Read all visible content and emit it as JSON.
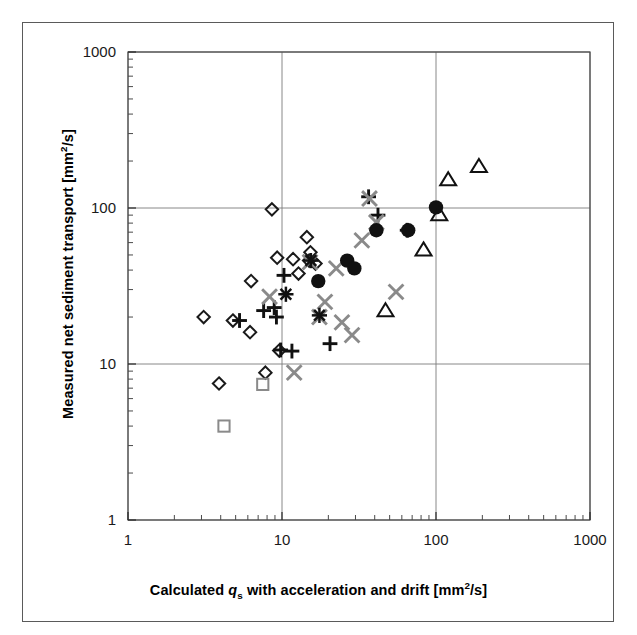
{
  "figure": {
    "title": "",
    "background_color": "#ffffff",
    "frame_color": "#5a5a5a"
  },
  "axes": {
    "x_title_parts": {
      "pre": "Calculated ",
      "italic_var": "q",
      "subscript": "s",
      "post": " with acceleration and drift  [mm",
      "superscript": "2",
      "tail": "/s]"
    },
    "y_title_parts": {
      "pre": "Measured net sediment transport  [mm",
      "superscript": "2",
      "tail": "/s]"
    },
    "x_tick_labels": [
      "1",
      "10",
      "100",
      "1000"
    ],
    "y_tick_labels": [
      "1",
      "10",
      "100",
      "1000"
    ]
  },
  "chart_data": {
    "type": "scatter",
    "title": "",
    "xlabel": "Calculated q_s with acceleration and drift  [mm2/s]",
    "ylabel": "Measured net sediment transport  [mm2/s]",
    "xscale": "log",
    "yscale": "log",
    "xlim": [
      1,
      1000
    ],
    "ylim": [
      1,
      1000
    ],
    "xticks": [
      1,
      10,
      100,
      1000
    ],
    "yticks": [
      1,
      10,
      100,
      1000
    ],
    "grid": true,
    "minor_ticks": true,
    "legend": null,
    "colors": {
      "diamond": "#1a1a1a",
      "square": "#8a8a8a",
      "plus": "#111111",
      "cross": "#8a8a8a",
      "star": "#111111",
      "circle": "#111111",
      "triangle": "#111111"
    },
    "series": [
      {
        "name": "open diamond",
        "marker": "diamond",
        "filled": false,
        "color": "#1a1a1a",
        "points": [
          [
            8.6,
            98
          ],
          [
            9.3,
            48
          ],
          [
            11.8,
            47
          ],
          [
            12.8,
            38
          ],
          [
            14.5,
            65
          ],
          [
            15.3,
            52
          ],
          [
            16.5,
            44
          ],
          [
            3.1,
            20
          ],
          [
            4.8,
            19
          ],
          [
            6.2,
            16
          ],
          [
            9.6,
            12.2
          ],
          [
            3.9,
            7.5
          ],
          [
            7.8,
            8.8
          ],
          [
            6.3,
            34
          ],
          [
            15.0,
            46
          ]
        ]
      },
      {
        "name": "open square",
        "marker": "square",
        "filled": false,
        "color": "#8a8a8a",
        "points": [
          [
            7.5,
            7.4
          ],
          [
            4.2,
            4.0
          ]
        ]
      },
      {
        "name": "plus",
        "marker": "plus",
        "filled": true,
        "color": "#111111",
        "points": [
          [
            7.6,
            22
          ],
          [
            8.9,
            23
          ],
          [
            5.3,
            19
          ],
          [
            9.2,
            20
          ],
          [
            9.8,
            12.3
          ],
          [
            11.6,
            12.1
          ],
          [
            10.3,
            37
          ],
          [
            36.5,
            118
          ],
          [
            20.5,
            13.5
          ],
          [
            65,
            72
          ],
          [
            42,
            90
          ]
        ]
      },
      {
        "name": "gray cross",
        "marker": "cross",
        "filled": true,
        "color": "#8a8a8a",
        "points": [
          [
            12.0,
            8.8
          ],
          [
            15.2,
            45
          ],
          [
            19.0,
            25
          ],
          [
            22.5,
            41
          ],
          [
            24.5,
            18.5
          ],
          [
            28.5,
            15.3
          ],
          [
            33,
            62
          ],
          [
            37,
            115
          ],
          [
            41,
            81
          ],
          [
            55,
            29
          ],
          [
            17.5,
            20
          ],
          [
            8.3,
            27
          ]
        ]
      },
      {
        "name": "black star",
        "marker": "star",
        "filled": true,
        "color": "#111111",
        "points": [
          [
            10.6,
            28
          ],
          [
            15.4,
            46
          ],
          [
            17.5,
            20.5
          ]
        ]
      },
      {
        "name": "filled circle",
        "marker": "circle",
        "filled": true,
        "color": "#111111",
        "points": [
          [
            17.2,
            34
          ],
          [
            26.5,
            46
          ],
          [
            29.5,
            41
          ],
          [
            41,
            72
          ],
          [
            66,
            72
          ],
          [
            100,
            101
          ]
        ]
      },
      {
        "name": "open triangle",
        "marker": "triangle",
        "filled": false,
        "color": "#111111",
        "points": [
          [
            105,
            91
          ],
          [
            120,
            152
          ],
          [
            190,
            185
          ],
          [
            83,
            54
          ],
          [
            47,
            22
          ]
        ]
      }
    ]
  }
}
